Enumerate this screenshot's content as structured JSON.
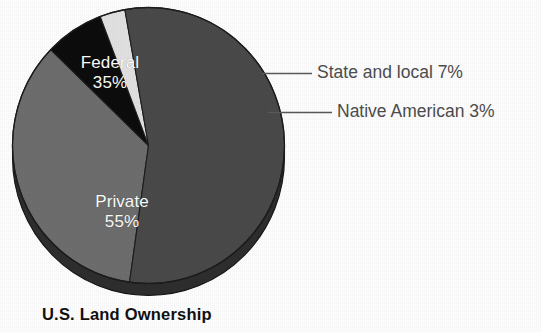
{
  "chart_data": {
    "type": "pie",
    "title": "U.S. Land Ownership",
    "xlabel": "",
    "ylabel": "",
    "legend_position": "none",
    "grid": false,
    "label_style": "inline-and-callout",
    "start_angle_deg": 188,
    "direction": "clockwise",
    "categories": [
      "Federal",
      "State and local",
      "Native American",
      "Private"
    ],
    "values": [
      35,
      7,
      3,
      55
    ],
    "slices": [
      {
        "name": "Federal",
        "value": 35,
        "percent_label": "35%",
        "label_text": "Federal",
        "color": "#6e6e6e",
        "label_placement": "inside",
        "label_color": "#ffffff"
      },
      {
        "name": "State and local",
        "value": 7,
        "percent_label": "7%",
        "label_text": "State and local 7%",
        "color": "#0d0d0d",
        "label_placement": "callout",
        "label_color": "#4d4d4d"
      },
      {
        "name": "Native American",
        "value": 3,
        "percent_label": "3%",
        "label_text": "Native American 3%",
        "color": "#e2e2e2",
        "label_placement": "callout",
        "label_color": "#4d4d4d"
      },
      {
        "name": "Private",
        "value": 55,
        "percent_label": "55%",
        "label_text": "Private",
        "color": "#4a4a4a",
        "label_placement": "inside",
        "label_color": "#ffffff"
      }
    ]
  },
  "pie": {
    "federal_label": "Federal",
    "federal_percent": "35%",
    "private_label": "Private",
    "private_percent": "55%"
  },
  "callouts": {
    "state_local": "State and local 7%",
    "native_american": "Native American 3%"
  },
  "title": {
    "text": "U.S. Land Ownership"
  },
  "colors": {
    "federal": "#6e6e6e",
    "private": "#4a4a4a",
    "state_local": "#0d0d0d",
    "native_american": "#e2e2e2",
    "depth_rim": "#2e2e2e",
    "outline": "#1a1a1a",
    "callout_text": "#4d4d4d",
    "title_text": "#111111",
    "background": "#ffffff"
  }
}
